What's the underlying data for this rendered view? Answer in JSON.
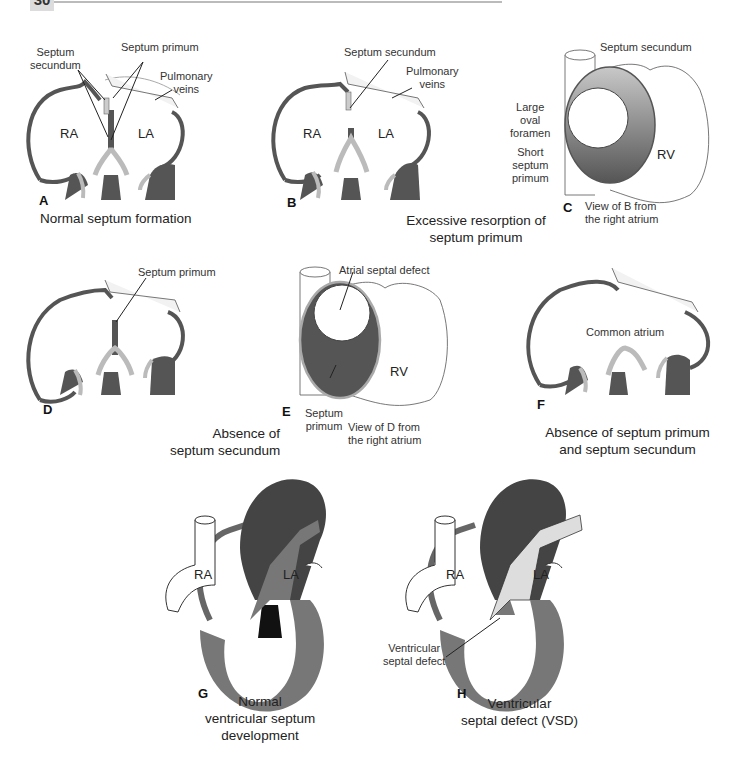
{
  "page": {
    "number": "30"
  },
  "colors": {
    "dark_tissue": "#555555",
    "light_tissue": "#bdbdbd",
    "medium_tissue": "#7a7a7a",
    "outline": "#333333",
    "background": "#ffffff"
  },
  "panels": {
    "A": {
      "letter": "A",
      "caption": "Normal septum formation",
      "labels": {
        "septum_secundum_l1": "Septum",
        "septum_secundum_l2": "secundum",
        "septum_primum": "Septum primum",
        "pulmonary_l1": "Pulmonary",
        "pulmonary_l2": "veins",
        "ra": "RA",
        "la": "LA"
      }
    },
    "B": {
      "letter": "B",
      "caption_l1": "Excessive resorption of",
      "caption_l2": "septum primum",
      "labels": {
        "septum_secundum": "Septum secundum",
        "pulmonary_l1": "Pulmonary",
        "pulmonary_l2": "veins",
        "ra": "RA",
        "la": "LA"
      }
    },
    "C": {
      "letter": "C",
      "caption_l1": "View of B from",
      "caption_l2": "the right atrium",
      "labels": {
        "septum_secundum": "Septum secundum",
        "large_l1": "Large",
        "large_l2": "oval",
        "large_l3": "foramen",
        "short_l1": "Short",
        "short_l2": "septum",
        "short_l3": "primum",
        "rv": "RV"
      }
    },
    "D": {
      "letter": "D",
      "caption_l1": "Absence of",
      "caption_l2": "septum secundum",
      "labels": {
        "septum_primum": "Septum primum"
      }
    },
    "E": {
      "letter": "E",
      "caption_l1": "View of D from",
      "caption_l2": "the right atrium",
      "labels": {
        "asd": "Atrial septal defect",
        "sp_l1": "Septum",
        "sp_l2": "primum",
        "rv": "RV"
      }
    },
    "F": {
      "letter": "F",
      "caption_l1": "Absence of septum primum",
      "caption_l2": "and septum secundum",
      "labels": {
        "common": "Common atrium"
      }
    },
    "G": {
      "letter": "G",
      "caption_l1": "Normal",
      "caption_l2": "ventricular septum",
      "caption_l3": "development",
      "labels": {
        "ra": "RA",
        "la": "LA"
      }
    },
    "H": {
      "letter": "H",
      "caption_l1": "Ventricular",
      "caption_l2": "septal defect (VSD)",
      "labels": {
        "vsd_l1": "Ventricular",
        "vsd_l2": "septal defect",
        "ra": "RA",
        "la": "LA"
      }
    }
  }
}
